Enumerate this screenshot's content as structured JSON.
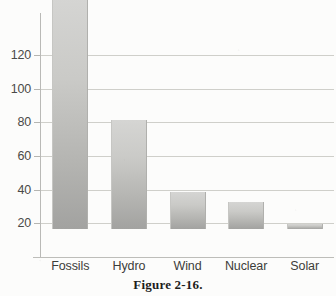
{
  "figure": {
    "caption": "Figure 2-16."
  },
  "chart_data": {
    "type": "bar",
    "title": "",
    "xlabel": "",
    "ylabel": "",
    "categories": [
      "Fossils",
      "Hydro",
      "Wind",
      "Nuclear",
      "Solar"
    ],
    "values": [
      138,
      65,
      22,
      16,
      3
    ],
    "ylim": [
      0,
      145
    ],
    "yticks": [
      20,
      40,
      60,
      80,
      100,
      120
    ],
    "ytick_labels": [
      "20",
      "40",
      "60",
      "80",
      "100",
      "120"
    ],
    "grid": true,
    "legend": false,
    "bar_fill_top": "#d5d5d3",
    "bar_fill_bottom": "#a2a2a0",
    "gridline_color": "#cfcfca",
    "axis_color": "#b9b9b6",
    "background": "#fcfcfb"
  }
}
